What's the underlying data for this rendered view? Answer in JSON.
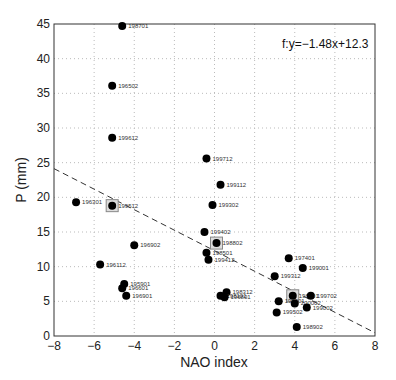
{
  "chart_data": {
    "type": "scatter",
    "title": "",
    "xlabel": "NAO index",
    "ylabel": "P (mm)",
    "xlim": [
      -8,
      8
    ],
    "ylim": [
      0,
      45
    ],
    "xticks": [
      -8,
      -6,
      -4,
      -2,
      0,
      2,
      4,
      6,
      8
    ],
    "yticks": [
      0,
      5,
      10,
      15,
      20,
      25,
      30,
      35,
      40,
      45
    ],
    "grid": true,
    "annotation": "f:y=−1.48x+12.3",
    "fit_line": {
      "slope": -1.48,
      "intercept": 12.3,
      "style": "dashed"
    },
    "points": [
      {
        "label": "198701",
        "x": -4.6,
        "y": 44.7
      },
      {
        "label": "196502",
        "x": -5.1,
        "y": 36.1
      },
      {
        "label": "199612",
        "x": -5.1,
        "y": 28.6
      },
      {
        "label": "196301",
        "x": -6.9,
        "y": 19.3
      },
      {
        "label": "199512",
        "x": -5.1,
        "y": 18.8,
        "boxed": true
      },
      {
        "label": "196902",
        "x": -4.0,
        "y": 13.1
      },
      {
        "label": "196112",
        "x": -5.7,
        "y": 10.3
      },
      {
        "label": "195901",
        "x": -4.5,
        "y": 7.5
      },
      {
        "label": "196601",
        "x": -4.6,
        "y": 6.9
      },
      {
        "label": "196901",
        "x": -4.4,
        "y": 5.8
      },
      {
        "label": "199712",
        "x": -0.4,
        "y": 25.6
      },
      {
        "label": "199112",
        "x": 0.3,
        "y": 21.8
      },
      {
        "label": "199302",
        "x": -0.1,
        "y": 18.9
      },
      {
        "label": "199402",
        "x": -0.5,
        "y": 15.0
      },
      {
        "label": "198802",
        "x": 0.1,
        "y": 13.4,
        "boxed": true
      },
      {
        "label": "198501",
        "x": -0.4,
        "y": 12.0
      },
      {
        "label": "199412",
        "x": -0.3,
        "y": 11.0
      },
      {
        "label": "198312",
        "x": 0.6,
        "y": 6.3
      },
      {
        "label": "198101",
        "x": 0.3,
        "y": 5.8
      },
      {
        "label": "196801",
        "x": 0.5,
        "y": 5.6
      },
      {
        "label": "197401",
        "x": 3.7,
        "y": 11.2
      },
      {
        "label": "199001",
        "x": 4.4,
        "y": 9.8
      },
      {
        "label": "199312",
        "x": 3.0,
        "y": 8.6
      },
      {
        "label": "198401",
        "x": 3.9,
        "y": 5.8,
        "boxed": true
      },
      {
        "label": "199702",
        "x": 4.8,
        "y": 5.8
      },
      {
        "label": "199301",
        "x": 3.2,
        "y": 5.0
      },
      {
        "label": "200002",
        "x": 4.0,
        "y": 4.7
      },
      {
        "label": "199002",
        "x": 4.6,
        "y": 4.1
      },
      {
        "label": "199502",
        "x": 3.1,
        "y": 3.4
      },
      {
        "label": "198902",
        "x": 4.1,
        "y": 1.3
      }
    ]
  }
}
